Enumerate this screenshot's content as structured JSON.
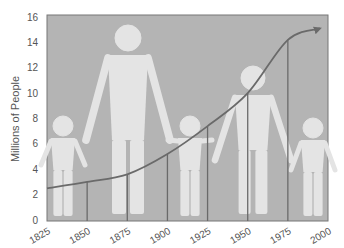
{
  "chart_data": {
    "type": "line",
    "title": "",
    "xlabel": "",
    "ylabel": "Millions of People",
    "x": [
      1825,
      1850,
      1875,
      1900,
      1925,
      1950,
      1975,
      1995
    ],
    "series": [
      {
        "name": "Population",
        "values": [
          2.5,
          3.0,
          3.6,
          5.2,
          7.4,
          10.0,
          14.2,
          15.1
        ]
      }
    ],
    "x_ticks": [
      "1825",
      "1850",
      "1875",
      "1900",
      "1925",
      "1950",
      "1975",
      "2000"
    ],
    "y_ticks": [
      "0",
      "2",
      "4",
      "6",
      "8",
      "10",
      "12",
      "14",
      "16"
    ],
    "xlim": [
      1825,
      2000
    ],
    "ylim": [
      0,
      16
    ],
    "grid": false,
    "drop_lines_at": [
      1850,
      1875,
      1900,
      1925,
      1950,
      1975
    ],
    "annotations": [
      "arrow at end of line",
      "background silhouettes of people holding hands"
    ],
    "colors": {
      "plot_background": "#b4b4b4",
      "figures": "#e4e4e4",
      "line": "#6a6a6a",
      "axes": "#777777"
    }
  }
}
